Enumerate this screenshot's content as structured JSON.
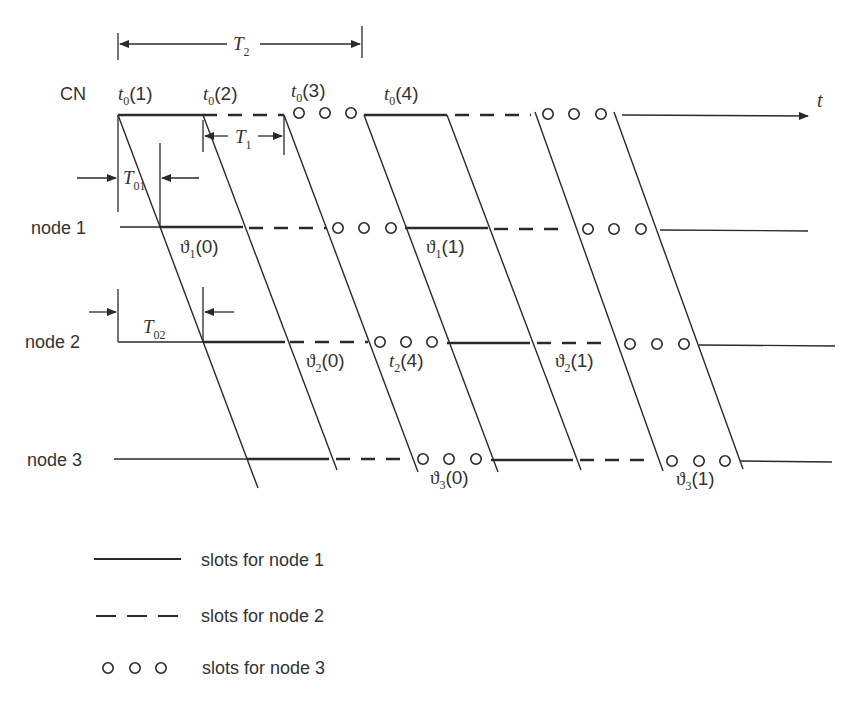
{
  "diagram": {
    "type": "timing-diagram",
    "time_axis_label": "t",
    "rows": [
      {
        "id": "cn",
        "label": "CN",
        "y": 115
      },
      {
        "id": "node1",
        "label": "node 1",
        "y": 228
      },
      {
        "id": "node2",
        "label": "node 2",
        "y": 342
      },
      {
        "id": "node3",
        "label": "node 3",
        "y": 460
      }
    ],
    "cn_slot_labels": [
      {
        "base": "t",
        "sub": "0",
        "arg": "(1)"
      },
      {
        "base": "t",
        "sub": "0",
        "arg": "(2)"
      },
      {
        "base": "t",
        "sub": "0",
        "arg": "(3)"
      },
      {
        "base": "t",
        "sub": "0",
        "arg": "(4)"
      }
    ],
    "node_labels": {
      "node1_a": {
        "base": "ϑ",
        "sub": "1",
        "arg": "(0)"
      },
      "node1_b": {
        "base": "ϑ",
        "sub": "1",
        "arg": "(1)"
      },
      "node2_a": {
        "base": "ϑ",
        "sub": "2",
        "arg": "(0)"
      },
      "node2_t": {
        "base": "t",
        "sub": "2",
        "arg": "(4)"
      },
      "node2_b": {
        "base": "ϑ",
        "sub": "2",
        "arg": "(1)"
      },
      "node3_a": {
        "base": "ϑ",
        "sub": "3",
        "arg": "(0)"
      },
      "node3_b": {
        "base": "ϑ",
        "sub": "3",
        "arg": "(1)"
      }
    },
    "intervals": {
      "T2": {
        "base": "T",
        "sub": "2"
      },
      "T1": {
        "base": "T",
        "sub": "1"
      },
      "T01": {
        "base": "T",
        "sub": "01"
      },
      "T02": {
        "base": "T",
        "sub": "02"
      }
    }
  },
  "legend": [
    {
      "style": "solid",
      "label": "slots for node 1"
    },
    {
      "style": "dashed",
      "label": "slots for node 2"
    },
    {
      "style": "circles",
      "label": "slots for node 3"
    }
  ]
}
